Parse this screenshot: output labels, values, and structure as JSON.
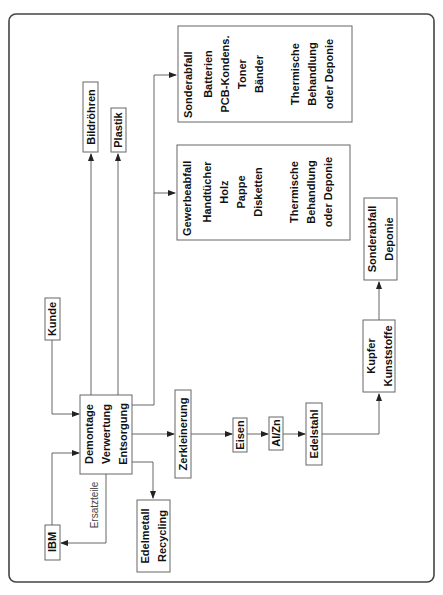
{
  "diagram": {
    "orientation": "rotated 90deg counter-clockwise",
    "nodes": {
      "center": {
        "lines": [
          "Demontage",
          "Verwertung",
          "Entsorgung"
        ]
      },
      "kunde": {
        "label": "Kunde"
      },
      "ibm": {
        "label": "IBM"
      },
      "ersatzteile": {
        "label": "Ersatzteile"
      },
      "bildroehren": {
        "label": "Bildröhren"
      },
      "plastik": {
        "label": "Plastik"
      },
      "sonderabfall": {
        "title": "Sonderabfall",
        "items": [
          "Batterien",
          "PCB-Kondens.",
          "Toner",
          "Bänder"
        ],
        "treatment": [
          "Thermische",
          "Behandlung",
          "oder Deponie"
        ]
      },
      "gewerbeabfall": {
        "title": "Gewerbeabfall",
        "items": [
          "Handtücher",
          "Holz",
          "Pappe",
          "Disketten"
        ],
        "treatment": [
          "Thermische",
          "Behandlung",
          "oder Deponie"
        ]
      },
      "edelmetall": {
        "lines": [
          "Edelmetall",
          "Recycling"
        ]
      },
      "zerkleinerung": {
        "label": "Zerkleinerung"
      },
      "eisen": {
        "label": "Eisen"
      },
      "alzn": {
        "label": "Al/Zn"
      },
      "edelstahl": {
        "label": "Edelstahl"
      },
      "kupfer": {
        "lines": [
          "Kupfer",
          "Kunststoffe"
        ]
      },
      "sonderabfall_deponie": {
        "lines": [
          "Sonderabfall",
          "Deponie"
        ]
      }
    },
    "edges": [
      {
        "from": "Kunde",
        "to": "Demontage/Verwertung/Entsorgung"
      },
      {
        "from": "IBM",
        "to": "Demontage/Verwertung/Entsorgung"
      },
      {
        "from": "Demontage/Verwertung/Entsorgung",
        "to": "IBM",
        "label": "Ersatzteile"
      },
      {
        "from": "Demontage/Verwertung/Entsorgung",
        "to": "Bildröhren"
      },
      {
        "from": "Demontage/Verwertung/Entsorgung",
        "to": "Plastik"
      },
      {
        "from": "Demontage/Verwertung/Entsorgung",
        "to": "Sonderabfall"
      },
      {
        "from": "Demontage/Verwertung/Entsorgung",
        "to": "Gewerbeabfall"
      },
      {
        "from": "Demontage/Verwertung/Entsorgung",
        "to": "Edelmetall Recycling"
      },
      {
        "from": "Demontage/Verwertung/Entsorgung",
        "to": "Zerkleinerung"
      },
      {
        "from": "Zerkleinerung",
        "to": "Eisen"
      },
      {
        "from": "Eisen",
        "to": "Al/Zn"
      },
      {
        "from": "Al/Zn",
        "to": "Edelstahl"
      },
      {
        "from": "Edelstahl",
        "to": "Kupfer Kunststoffe"
      },
      {
        "from": "Kupfer Kunststoffe",
        "to": "Sonderabfall Deponie"
      }
    ]
  }
}
